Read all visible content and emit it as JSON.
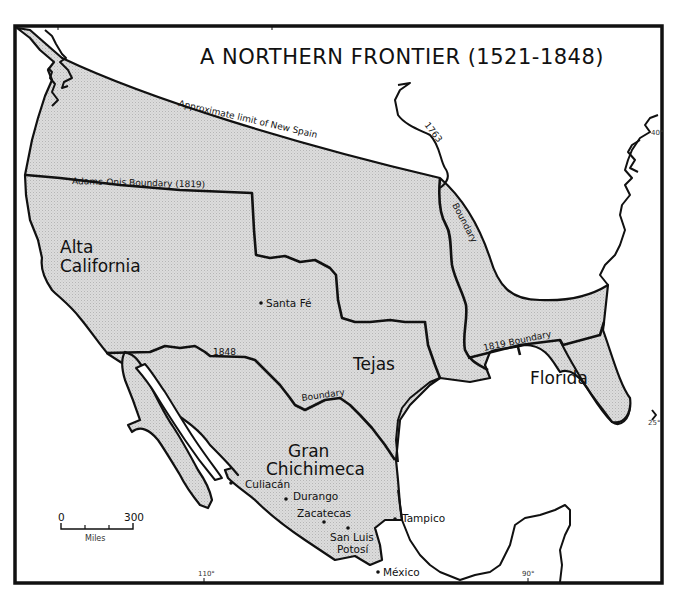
{
  "map": {
    "title": "A NORTHERN FRONTIER (1521-1848)",
    "regions": [
      {
        "name": "alta-california",
        "line1": "Alta",
        "line2": "California"
      },
      {
        "name": "tejas",
        "line1": "Tejas"
      },
      {
        "name": "gran-chichimeca",
        "line1": "Gran",
        "line2": "Chichimeca"
      },
      {
        "name": "florida",
        "line1": "Florida"
      }
    ],
    "cities": [
      {
        "name": "Santa Fé"
      },
      {
        "name": "Culiacán"
      },
      {
        "name": "Durango"
      },
      {
        "name": "Zacatecas"
      },
      {
        "name": "San Luis",
        "name2": "Potosí"
      },
      {
        "name": "Tampico"
      },
      {
        "name": "México"
      }
    ],
    "boundaries": {
      "new_spain_limit": "Approximate limit of New Spain",
      "adams_onis": "Adams-Onis Boundary (1819)",
      "b1848_year": "1848",
      "b1848_word": "Boundary",
      "b1763_year": "1763",
      "b1763_word": "Boundary",
      "b1819": "1819 Boundary"
    },
    "graticule": {
      "lat_40": "40°",
      "lat_25": "25°",
      "lon_110": "110°",
      "lon_90": "90°"
    },
    "scale_bar": {
      "min": "0",
      "max": "300",
      "unit": "Miles"
    },
    "colors": {
      "ink": "#111111",
      "land_fill": "#d9d9d9",
      "paper": "#ffffff"
    }
  }
}
